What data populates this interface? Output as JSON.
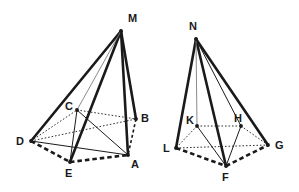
{
  "diagram": {
    "background_color": "#ffffff",
    "stroke_color": "#1a1a1a",
    "light_stroke_color": "#7d7d7d",
    "figures": [
      {
        "name": "left-pyramid",
        "apex_label": "M",
        "vertices": [
          {
            "id": "M",
            "label": "M",
            "x": 121,
            "y": 31,
            "label_x": 128,
            "label_y": 22,
            "dot": true
          },
          {
            "id": "C",
            "label": "C",
            "x": 77,
            "y": 110,
            "label_x": 65,
            "label_y": 110,
            "dot": true
          },
          {
            "id": "B",
            "label": "B",
            "x": 136,
            "y": 119,
            "label_x": 141,
            "label_y": 122,
            "dot": true
          },
          {
            "id": "D",
            "label": "D",
            "x": 31,
            "y": 141,
            "label_x": 16,
            "label_y": 145,
            "dot": true
          },
          {
            "id": "A",
            "label": "A",
            "x": 128,
            "y": 155,
            "label_x": 131,
            "label_y": 168,
            "dot": true
          },
          {
            "id": "E",
            "label": "E",
            "x": 70,
            "y": 162,
            "label_x": 65,
            "label_y": 177,
            "dot": true
          }
        ],
        "edges": [
          {
            "from": "M",
            "to": "D",
            "style": "thick-solid"
          },
          {
            "from": "M",
            "to": "A",
            "style": "thick-solid"
          },
          {
            "from": "M",
            "to": "B",
            "style": "thick-solid"
          },
          {
            "from": "M",
            "to": "E",
            "style": "thick-solid"
          },
          {
            "from": "M",
            "to": "C",
            "style": "thin-gray"
          },
          {
            "from": "D",
            "to": "A",
            "style": "thin-solid"
          },
          {
            "from": "D",
            "to": "E",
            "style": "thick-dashed"
          },
          {
            "from": "E",
            "to": "A",
            "style": "thick-dashed"
          },
          {
            "from": "D",
            "to": "C",
            "style": "dotted"
          },
          {
            "from": "C",
            "to": "B",
            "style": "dotted"
          },
          {
            "from": "D",
            "to": "B",
            "style": "dotted"
          },
          {
            "from": "B",
            "to": "A",
            "style": "dashed"
          },
          {
            "from": "C",
            "to": "A",
            "style": "thin-solid"
          },
          {
            "from": "C",
            "to": "E",
            "style": "thin-solid"
          }
        ]
      },
      {
        "name": "right-pyramid",
        "apex_label": "N",
        "vertices": [
          {
            "id": "N",
            "label": "N",
            "x": 196,
            "y": 39,
            "label_x": 189,
            "label_y": 30,
            "dot": true
          },
          {
            "id": "K",
            "label": "K",
            "x": 197,
            "y": 126,
            "label_x": 186,
            "label_y": 124,
            "dot": true
          },
          {
            "id": "H",
            "label": "H",
            "x": 241,
            "y": 126,
            "label_x": 234,
            "label_y": 122,
            "dot": true
          },
          {
            "id": "L",
            "label": "L",
            "x": 176,
            "y": 148,
            "label_x": 163,
            "label_y": 152,
            "dot": true
          },
          {
            "id": "G",
            "label": "G",
            "x": 268,
            "y": 145,
            "label_x": 275,
            "label_y": 149,
            "dot": true
          },
          {
            "id": "F",
            "label": "F",
            "x": 226,
            "y": 166,
            "label_x": 222,
            "label_y": 181,
            "dot": true
          }
        ],
        "edges": [
          {
            "from": "N",
            "to": "L",
            "style": "thick-solid"
          },
          {
            "from": "N",
            "to": "F",
            "style": "thick-solid"
          },
          {
            "from": "N",
            "to": "G",
            "style": "thick-solid"
          },
          {
            "from": "N",
            "to": "H",
            "style": "thin-solid"
          },
          {
            "from": "N",
            "to": "K",
            "style": "thin-gray"
          },
          {
            "from": "K",
            "to": "H",
            "style": "dotted"
          },
          {
            "from": "K",
            "to": "L",
            "style": "dotted"
          },
          {
            "from": "H",
            "to": "G",
            "style": "dotted"
          },
          {
            "from": "L",
            "to": "G",
            "style": "dotted"
          },
          {
            "from": "L",
            "to": "F",
            "style": "thick-dashed"
          },
          {
            "from": "F",
            "to": "G",
            "style": "thick-dashed"
          },
          {
            "from": "K",
            "to": "F",
            "style": "thin-solid"
          },
          {
            "from": "H",
            "to": "F",
            "style": "thin-solid"
          }
        ]
      }
    ]
  }
}
